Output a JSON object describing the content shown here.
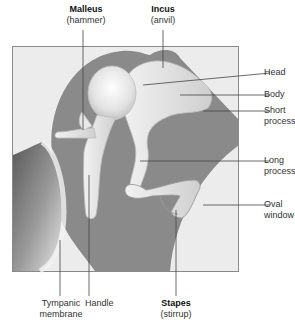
{
  "labels": {
    "malleus": {
      "name": "Malleus",
      "common": "(hammer)"
    },
    "incus": {
      "name": "Incus",
      "common": "(anvil)"
    },
    "stapes": {
      "name": "Stapes",
      "common": "(stirrup)"
    },
    "head": "Head",
    "body": "Body",
    "short_process": [
      "Short",
      "process"
    ],
    "long_process": [
      "Long",
      "process"
    ],
    "oval_window": [
      "Oval",
      "window"
    ],
    "tympanic_membrane": [
      "Tympanic",
      "membrane"
    ],
    "handle": "Handle"
  },
  "colors": {
    "background": "#ffffff",
    "frame_fill": "#ececec",
    "cavity": "#8a8a8a",
    "bone": "#e4e4e4",
    "bone_shadow": "#bdbdbd",
    "leader": "#444444"
  }
}
